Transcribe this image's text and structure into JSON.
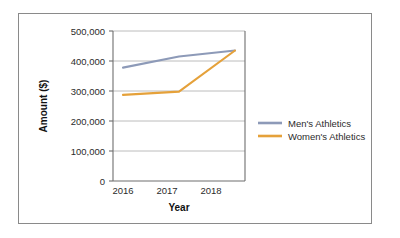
{
  "figure": {
    "border_color": "#8a8a8a",
    "background": "#ffffff"
  },
  "chart_data": {
    "type": "line",
    "title": "",
    "xlabel": "Year",
    "ylabel": "Amount ($)",
    "categories": [
      "2016",
      "2017",
      "2018"
    ],
    "x_tick_labels": [
      "2016",
      "2017",
      "2018"
    ],
    "y_tick_labels": [
      "0",
      "100,000",
      "200,000",
      "300,000",
      "400,000",
      "500,000"
    ],
    "y_tick_values": [
      0,
      100000,
      200000,
      300000,
      400000,
      500000
    ],
    "ylim": [
      0,
      500000
    ],
    "grid": "horizontal",
    "legend_position": "right",
    "series": [
      {
        "name": "Men's Athletics",
        "color": "#8d9ab8",
        "values": [
          378000,
          415000,
          435000
        ]
      },
      {
        "name": "Women's Athletics",
        "color": "#e5a13a",
        "values": [
          287000,
          298000,
          435000
        ]
      }
    ]
  },
  "axis": {
    "y_title": "Amount ($)",
    "x_title": "Year",
    "y_labels": {
      "t0": "0",
      "t1": "100,000",
      "t2": "200,000",
      "t3": "300,000",
      "t4": "400,000",
      "t5": "500,000"
    },
    "x_labels": {
      "t0": "2016",
      "t1": "2017",
      "t2": "2018"
    }
  },
  "legend": {
    "items": [
      {
        "label": "Men's Athletics",
        "color": "#8d9ab8"
      },
      {
        "label": "Women's Athletics",
        "color": "#e5a13a"
      }
    ]
  }
}
